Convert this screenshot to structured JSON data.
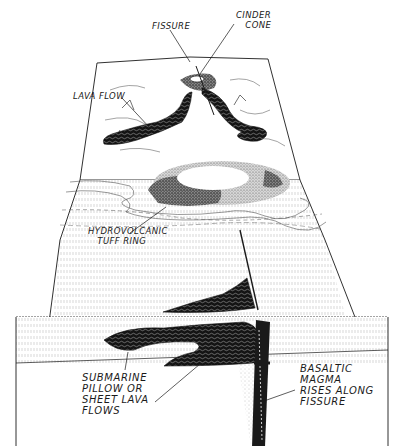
{
  "diagram": {
    "colors": {
      "ink": "#1a1a1a",
      "paper": "#ffffff",
      "stipple": "#9a9a9a"
    },
    "labels": {
      "fissure": "FISSURE",
      "cinder_cone": "CINDER\n   CONE",
      "lava_flow": "LAVA FLOW",
      "tuff_ring": "HYDROVOLCANIC\n   TUFF RING",
      "submarine_flows": "SUBMARINE\nPILLOW OR\nSHEET LAVA\nFLOWS",
      "basaltic_magma": "BASALTIC\nMAGMA\nRISES ALONG\nFISSURE"
    }
  }
}
